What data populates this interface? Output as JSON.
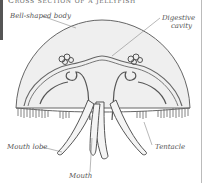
{
  "title": "Cross section of a jellyfish",
  "labels": {
    "bell": "Bell-shaped body",
    "digestive": "Digestive cavity",
    "mouth_lobe": "Mouth lobe",
    "tentacle": "Tentacle",
    "mouth": "Mouth"
  },
  "colors": {
    "line": "#555555",
    "fill": "#eeeeee",
    "label": "#555555"
  }
}
